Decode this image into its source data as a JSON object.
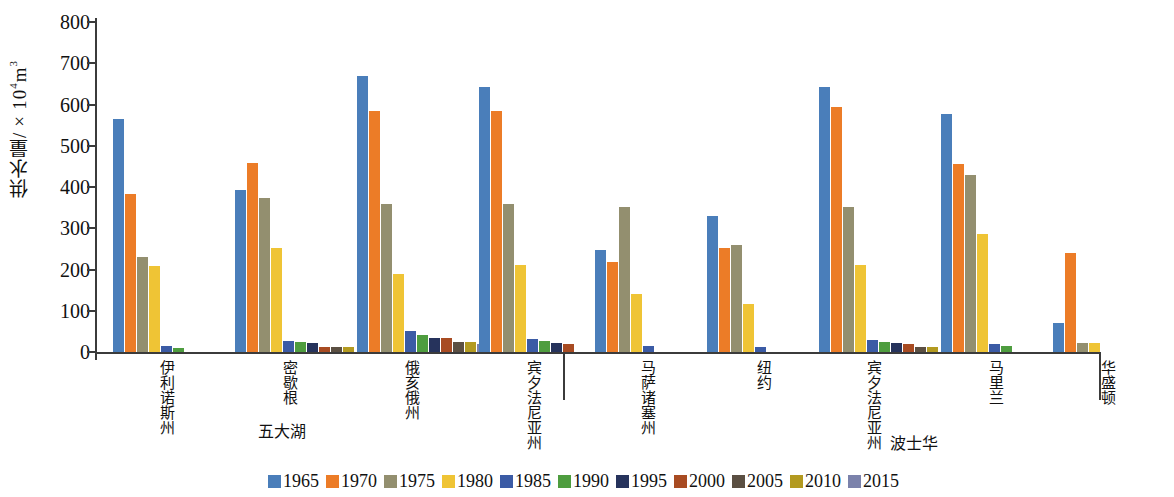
{
  "chart_data": {
    "type": "bar",
    "title": "",
    "xlabel": "",
    "ylabel": "供水量/×10⁴m³",
    "ylim": [
      0,
      800
    ],
    "ytick_values": [
      0,
      100,
      200,
      300,
      400,
      500,
      600,
      700,
      800
    ],
    "ytick_labels": [
      "0",
      "100",
      "200",
      "300",
      "400",
      "500",
      "600",
      "700",
      "800"
    ],
    "grid": false,
    "legend_position": "bottom-center",
    "categories": [
      "伊利诺斯州",
      "密歇根",
      "俄亥俄州",
      "宾夕法尼亚州",
      "马萨诸塞州",
      "纽约",
      "宾夕法尼亚州",
      "马里兰",
      "华盛顿"
    ],
    "regions": [
      {
        "label": "五大湖",
        "categories": [
          "伊利诺斯州",
          "密歇根",
          "俄亥俄州",
          "宾夕法尼亚州"
        ]
      },
      {
        "label": "波士华",
        "categories": [
          "马萨诸塞州",
          "纽约",
          "宾夕法尼亚州",
          "马里兰",
          "华盛顿"
        ]
      }
    ],
    "series": [
      {
        "name": "1965",
        "color": "#4a7eba",
        "values": [
          565,
          393,
          670,
          643,
          247,
          329,
          643,
          576,
          70
        ]
      },
      {
        "name": "1970",
        "color": "#ec7c27",
        "values": [
          383,
          459,
          585,
          584,
          218,
          252,
          595,
          457,
          241
        ]
      },
      {
        "name": "1975",
        "color": "#938f6f",
        "values": [
          231,
          374,
          359,
          360,
          351,
          259,
          352,
          430,
          22
        ]
      },
      {
        "name": "1980",
        "color": "#efc435",
        "values": [
          209,
          253,
          189,
          212,
          141,
          117,
          212,
          285,
          22
        ]
      },
      {
        "name": "1985",
        "color": "#3b5ba5",
        "values": [
          15,
          27,
          50,
          31,
          14,
          13,
          30,
          19,
          0
        ]
      },
      {
        "name": "1990",
        "color": "#4e9d3f",
        "values": [
          9,
          25,
          42,
          26,
          0,
          0,
          25,
          15,
          0
        ]
      },
      {
        "name": "1995",
        "color": "#26335c",
        "values": [
          0,
          22,
          33,
          21,
          0,
          0,
          22,
          0,
          0
        ]
      },
      {
        "name": "2000",
        "color": "#a84b22",
        "values": [
          0,
          12,
          33,
          19,
          0,
          0,
          19,
          0,
          0
        ]
      },
      {
        "name": "2005",
        "color": "#5b4f42",
        "values": [
          0,
          12,
          24,
          0,
          0,
          0,
          12,
          0,
          0
        ]
      },
      {
        "name": "2010",
        "color": "#b39a20",
        "values": [
          0,
          12,
          24,
          0,
          0,
          0,
          12,
          0,
          0
        ]
      },
      {
        "name": "2015",
        "color": "#7b82ab",
        "values": [
          0,
          0,
          20,
          0,
          0,
          0,
          0,
          0,
          0
        ]
      }
    ]
  },
  "legend": {
    "items": [
      {
        "label": "1965"
      },
      {
        "label": "1970"
      },
      {
        "label": "1975"
      },
      {
        "label": "1980"
      },
      {
        "label": "1985"
      },
      {
        "label": "1990"
      },
      {
        "label": "1995"
      },
      {
        "label": "2000"
      },
      {
        "label": "2005"
      },
      {
        "label": "2010"
      },
      {
        "label": "2015"
      }
    ]
  }
}
